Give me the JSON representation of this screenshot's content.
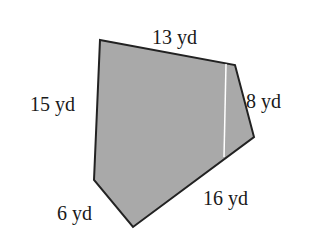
{
  "figure": {
    "shape": "pentagon",
    "fill_color": "#a9a9a9",
    "stroke_color": "#222222",
    "divider_color": "#ffffff",
    "vertices": [
      [
        100,
        40
      ],
      [
        235,
        65
      ],
      [
        254,
        137
      ],
      [
        133,
        227
      ],
      [
        94,
        180
      ]
    ],
    "divider": [
      [
        226,
        63
      ],
      [
        224,
        158
      ]
    ],
    "labels": {
      "top": "13 yd",
      "left": "15 yd",
      "right": "8 yd",
      "bottom_right": "16 yd",
      "bottom_left": "6 yd"
    }
  }
}
